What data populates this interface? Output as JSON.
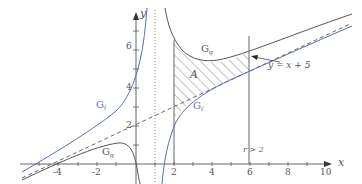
{
  "diagram": {
    "axes": {
      "x_label": "x",
      "y_label": "y",
      "x_ticks": [
        {
          "value": -4,
          "label": "-4"
        },
        {
          "value": -2,
          "label": "-2"
        },
        {
          "value": 2,
          "label": "2"
        },
        {
          "value": 4,
          "label": "4"
        },
        {
          "value": 6,
          "label": "6"
        },
        {
          "value": 8,
          "label": "8"
        },
        {
          "value": 10,
          "label": "10"
        }
      ],
      "y_ticks": [
        {
          "value": 2,
          "label": "2"
        },
        {
          "value": 4,
          "label": "4"
        },
        {
          "value": 6,
          "label": "6"
        }
      ]
    },
    "curves": {
      "gf_label_left": "G",
      "gf_sub_left": "f",
      "gf_label_right": "G",
      "gf_sub_right": "f",
      "gg_label_top": "G",
      "gg_sub_top": "g",
      "gg_label_bottom": "G",
      "gg_sub_bottom": "g"
    },
    "asymptote_label": "y = x + 5",
    "area_label": "A",
    "boundary_label": "r > 2",
    "colors": {
      "gf": "#5a6fb0",
      "gg": "#555555",
      "axis": "#555555",
      "hatch": "#666666"
    }
  }
}
